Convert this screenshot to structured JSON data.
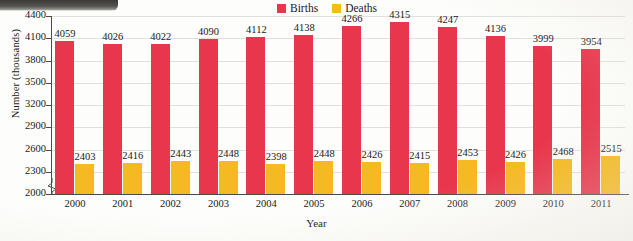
{
  "chart_data": {
    "type": "bar",
    "title": "",
    "xlabel": "Year",
    "ylabel": "Number (thousands)",
    "categories": [
      "2000",
      "2001",
      "2002",
      "2003",
      "2004",
      "2005",
      "2006",
      "2007",
      "2008",
      "2009",
      "2010",
      "2011"
    ],
    "series": [
      {
        "name": "Births",
        "color": "#e8364c",
        "values": [
          4059,
          4026,
          4022,
          4090,
          4112,
          4138,
          4266,
          4315,
          4247,
          4136,
          3999,
          3954
        ]
      },
      {
        "name": "Deaths",
        "color": "#f5b921",
        "values": [
          2403,
          2416,
          2443,
          2448,
          2398,
          2448,
          2426,
          2415,
          2453,
          2426,
          2468,
          2515
        ]
      }
    ],
    "ylim": [
      2000,
      4400
    ],
    "ytick_labels": [
      "2000",
      "2300",
      "2600",
      "2900",
      "3200",
      "3500",
      "3800",
      "4100",
      "4400"
    ],
    "ytick_values": [
      2000,
      2300,
      2600,
      2900,
      3200,
      3500,
      3800,
      4100,
      4400
    ],
    "y_axis_break": true,
    "grid": true,
    "legend_position": "top-center",
    "data_labels": true
  },
  "legend": {
    "births_label": "Births",
    "deaths_label": "Deaths"
  },
  "axes": {
    "x_title": "Year",
    "y_title": "Number (thousands)"
  }
}
